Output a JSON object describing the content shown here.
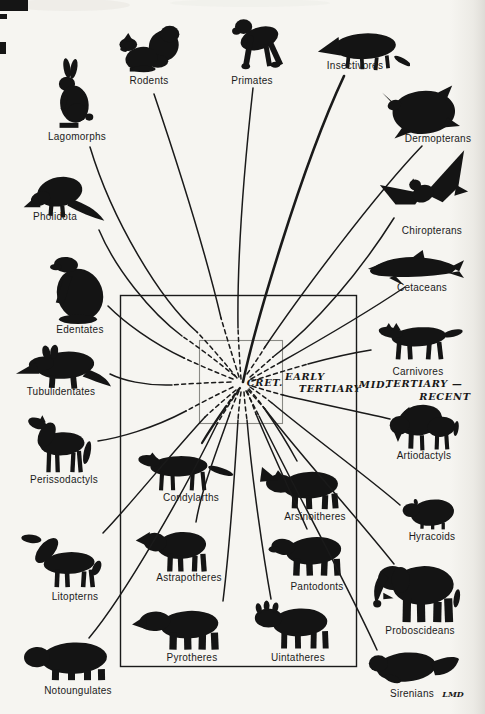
{
  "figure": {
    "colors": {
      "background": "#f6f5f1",
      "ink": "#1a1a1a",
      "label_ink": "#1b1b1b",
      "inner_box": "#8a8a85",
      "paper_shade": "#e4e2dc"
    },
    "era": {
      "cret": "CRET.",
      "early_line1": "EARLY",
      "early_line2": "TERTIARY",
      "mid_line1": "MID.",
      "mid_line2": "TERTIARY —",
      "mid_line3": "RECENT"
    },
    "signature": "LMD",
    "nodes": [
      {
        "id": "rodents",
        "label": "Rodents"
      },
      {
        "id": "primates",
        "label": "Primates"
      },
      {
        "id": "insectivores",
        "label": "Insectivores"
      },
      {
        "id": "lagomorphs",
        "label": "Lagomorphs"
      },
      {
        "id": "dermopterans",
        "label": "Dermopterans"
      },
      {
        "id": "pholidota",
        "label": "Pholidota"
      },
      {
        "id": "chiropterans",
        "label": "Chiropterans"
      },
      {
        "id": "edentates",
        "label": "Edentates"
      },
      {
        "id": "cetaceans",
        "label": "Cetaceans"
      },
      {
        "id": "tubulidentates",
        "label": "Tubulidentates"
      },
      {
        "id": "carnivores",
        "label": "Carnivores"
      },
      {
        "id": "perissodactyls",
        "label": "Perissodactyls"
      },
      {
        "id": "artiodactyls",
        "label": "Artiodactyls"
      },
      {
        "id": "condylarths",
        "label": "Condylarths"
      },
      {
        "id": "arsinoitheres",
        "label": "Arsinoitheres"
      },
      {
        "id": "hyracoids",
        "label": "Hyracoids"
      },
      {
        "id": "astrapotheres",
        "label": "Astrapotheres"
      },
      {
        "id": "pantodonts",
        "label": "Pantodonts"
      },
      {
        "id": "litopterns",
        "label": "Litopterns"
      },
      {
        "id": "proboscideans",
        "label": "Proboscideans"
      },
      {
        "id": "pyrotheres",
        "label": "Pyrotheres"
      },
      {
        "id": "uintatheres",
        "label": "Uintatheres"
      },
      {
        "id": "notoungulates",
        "label": "Notoungulates"
      },
      {
        "id": "sirenians",
        "label": "Sirenians"
      }
    ]
  }
}
